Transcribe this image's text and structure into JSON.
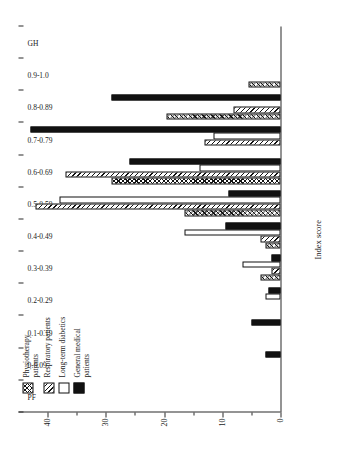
{
  "chart_data": {
    "type": "bar",
    "title": "",
    "xlabel": "Index score",
    "ylabel": "",
    "ylim": [
      0,
      45
    ],
    "yticks": [
      0,
      10,
      20,
      30,
      40
    ],
    "ytick_labels": [
      "0",
      "10",
      "20",
      "30",
      "40"
    ],
    "grid": false,
    "legend_position": "upper-left",
    "orientation": "vertical-bars-rotated-page",
    "categories": [
      "PF",
      "0-0.09",
      "0.1-0.19",
      "0.2-0.29",
      "0.3-0.39",
      "0.4-0.49",
      "0.5-0.59",
      "0.6-0.69",
      "0.7-0.79",
      "0.8-0.89",
      "0.9-1.0",
      "GH"
    ],
    "series": [
      {
        "name": "Physiotherapy patients",
        "pattern": "cross-hatch",
        "values": [
          0,
          0,
          0,
          0,
          3.5,
          2.5,
          16.5,
          29,
          0,
          19.5,
          5.5,
          0
        ]
      },
      {
        "name": "Respiratory patients",
        "pattern": "diagonal-hatch",
        "values": [
          0,
          0,
          0,
          0,
          1.5,
          3.5,
          42,
          37,
          13,
          8,
          0,
          0
        ]
      },
      {
        "name": "Long-term diabetics",
        "pattern": "open-white",
        "values": [
          0,
          0,
          0,
          2.5,
          6.5,
          16.5,
          38,
          14,
          11.5,
          0,
          0,
          0
        ]
      },
      {
        "name": "General medical patients",
        "pattern": "solid-black",
        "values": [
          0,
          2.5,
          5,
          2,
          1.5,
          9.5,
          9,
          26,
          43,
          29,
          0,
          0
        ]
      }
    ]
  },
  "legend": {
    "items": [
      {
        "label": "Physiotherapy patients",
        "key": "physio"
      },
      {
        "label": "Respiratory patients",
        "key": "resp"
      },
      {
        "label": "Long-term diabetics",
        "key": "diab"
      },
      {
        "label": "General medical patients",
        "key": "genmed"
      }
    ]
  },
  "axes": {
    "x_title": "Index score",
    "y_title": ""
  },
  "caption": {
    "text": ""
  }
}
